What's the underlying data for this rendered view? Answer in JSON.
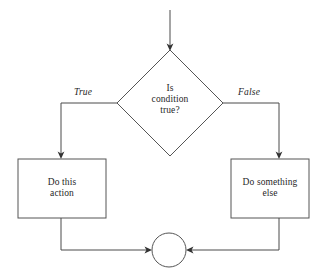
{
  "diagram": {
    "type": "flowchart",
    "background_color": "#ffffff",
    "stroke_color": "#4a4a4a",
    "text_color": "#1f1f1f",
    "nodes": {
      "decision": {
        "shape": "diamond",
        "text": "Is\ncondition\ntrue?"
      },
      "process_true": {
        "shape": "rectangle",
        "text": "Do this\naction"
      },
      "process_false": {
        "shape": "rectangle",
        "text": "Do something\nelse"
      },
      "merge": {
        "shape": "circle",
        "text": ""
      }
    },
    "edge_labels": {
      "true_branch": "True",
      "false_branch": "False"
    }
  }
}
